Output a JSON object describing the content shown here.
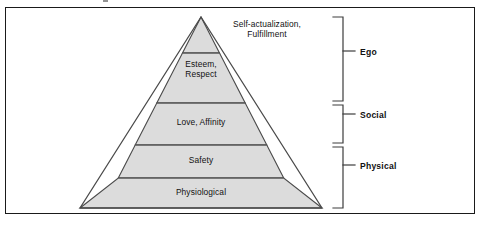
{
  "figure": {
    "frame_border_color": "#1a1a1a",
    "background_color": "#ffffff"
  },
  "pyramid": {
    "fill_color": "#dcdcdc",
    "outline_color": "#4a4a4a",
    "divider_color": "#5a5a5a",
    "apex": {
      "x": 201,
      "y": 17
    },
    "base": {
      "left_x": 80,
      "right_x": 322,
      "y": 208
    },
    "tiers": [
      {
        "id": "self-actualization",
        "level": 5,
        "label": "Self-actualization,\nFulfillment",
        "label_placement": "outside-right",
        "top_y": 17,
        "bottom_y": 53
      },
      {
        "id": "esteem",
        "level": 4,
        "label": "Esteem,\nRespect",
        "label_placement": "inside",
        "top_y": 53,
        "bottom_y": 103
      },
      {
        "id": "love-affinity",
        "level": 3,
        "label": "Love, Affinity",
        "label_placement": "inside",
        "top_y": 103,
        "bottom_y": 145
      },
      {
        "id": "safety",
        "level": 2,
        "label": "Safety",
        "label_placement": "inside",
        "top_y": 145,
        "bottom_y": 178
      },
      {
        "id": "physiological",
        "level": 1,
        "label": "Physiological",
        "label_placement": "inside",
        "top_y": 178,
        "bottom_y": 208
      }
    ]
  },
  "brackets": [
    {
      "id": "ego",
      "label": "Ego",
      "top_y": 17,
      "bottom_y": 101,
      "tick_y": 51,
      "covers_tiers": [
        "self-actualization",
        "esteem"
      ]
    },
    {
      "id": "social",
      "label": "Social",
      "top_y": 105,
      "bottom_y": 143,
      "tick_y": 114,
      "covers_tiers": [
        "love-affinity"
      ]
    },
    {
      "id": "physical",
      "label": "Physical",
      "top_y": 147,
      "bottom_y": 208,
      "tick_y": 165,
      "covers_tiers": [
        "safety",
        "physiological"
      ]
    }
  ],
  "bracket_geometry": {
    "spine_x": 343,
    "arm_length": 10,
    "tick_x_start": 343,
    "tick_x_end": 355,
    "label_x": 360,
    "line_color": "#3c3c3c"
  },
  "colors": {
    "text": "#111111",
    "frame": "#1a1a1a",
    "pyramid_fill": "#dcdcdc",
    "pyramid_stroke": "#4a4a4a"
  }
}
